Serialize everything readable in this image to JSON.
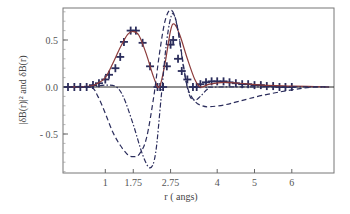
{
  "chart_data": {
    "type": "line",
    "title": "",
    "xlabel": "r ( angs)",
    "ylabel": "|δB(r)|² and δB(r)",
    "xlim": [
      -0.13,
      7.13
    ],
    "ylim": [
      -0.91,
      0.84
    ],
    "grid": false,
    "legend": null,
    "x_ticks": [
      {
        "value": 1,
        "label": "1"
      },
      {
        "value": 1.75,
        "label": "1.75"
      },
      {
        "value": 2.75,
        "label": "2.75"
      },
      {
        "value": 4,
        "label": "4"
      },
      {
        "value": 5,
        "label": "5"
      },
      {
        "value": 6,
        "label": "6"
      }
    ],
    "y_ticks": [
      {
        "value": 0.5,
        "label": "0.5"
      },
      {
        "value": 0.0,
        "label": "0.0"
      },
      {
        "value": -0.5,
        "label": "- 0.5"
      }
    ],
    "series": [
      {
        "name": "|δB(r)|² data",
        "style": "markers-cross",
        "color": "#2b2d5c",
        "x": [
          0.0,
          0.17,
          0.33,
          0.5,
          0.67,
          0.83,
          1.0,
          1.1,
          1.27,
          1.4,
          1.5,
          1.68,
          1.82,
          2.0,
          2.2,
          2.4,
          2.47,
          2.55,
          2.65,
          2.75,
          2.82,
          2.95,
          3.05,
          3.2,
          3.35,
          3.45,
          3.55,
          3.7,
          3.85,
          4.0,
          4.17,
          4.33,
          4.5,
          4.67,
          4.83,
          5.0,
          5.17,
          5.33,
          5.5,
          5.67,
          5.83,
          6.0
        ],
        "y": [
          0.0,
          0.0,
          0.0,
          0.0,
          0.02,
          0.04,
          0.08,
          0.13,
          0.2,
          0.32,
          0.48,
          0.6,
          0.6,
          0.47,
          0.22,
          0.0,
          0.0,
          0.0,
          0.22,
          0.45,
          0.5,
          0.3,
          0.17,
          0.08,
          0.0,
          0.0,
          0.03,
          0.05,
          0.06,
          0.06,
          0.06,
          0.05,
          0.04,
          0.03,
          0.03,
          0.02,
          0.02,
          0.01,
          0.01,
          0.0,
          0.0,
          0.0
        ]
      },
      {
        "name": "|δB(r)|² fit",
        "style": "solid",
        "color": "#8b3a3a",
        "x": [
          0.0,
          0.6,
          0.8,
          1.0,
          1.2,
          1.4,
          1.6,
          1.75,
          1.9,
          2.1,
          2.3,
          2.45,
          2.6,
          2.75,
          2.85,
          3.0,
          3.2,
          3.4,
          3.55,
          3.8,
          4.2,
          4.6,
          5.2,
          6.0,
          7.0
        ],
        "y": [
          0.0,
          0.01,
          0.04,
          0.1,
          0.25,
          0.42,
          0.56,
          0.59,
          0.55,
          0.35,
          0.1,
          0.0,
          0.25,
          0.6,
          0.67,
          0.55,
          0.3,
          0.08,
          0.0,
          0.03,
          0.05,
          0.04,
          0.02,
          0.01,
          0.0
        ]
      },
      {
        "name": "δB(r) dashed",
        "style": "dashed",
        "color": "#2b2d5c",
        "x": [
          0.0,
          0.6,
          0.8,
          1.0,
          1.2,
          1.4,
          1.6,
          1.75,
          1.9,
          2.1,
          2.3,
          2.45,
          2.6,
          2.75,
          2.9,
          3.05,
          3.2,
          3.4,
          3.6,
          3.8,
          4.2,
          4.6,
          5.2,
          6.0,
          6.6,
          7.0
        ],
        "y": [
          0.0,
          0.0,
          -0.1,
          -0.28,
          -0.48,
          -0.62,
          -0.72,
          -0.74,
          -0.72,
          -0.55,
          -0.1,
          0.35,
          0.7,
          0.82,
          0.7,
          0.35,
          0.0,
          -0.15,
          -0.2,
          -0.21,
          -0.19,
          -0.15,
          -0.09,
          -0.03,
          0.0,
          0.0
        ]
      },
      {
        "name": "δB(r) dash-dot",
        "style": "dash-dot",
        "color": "#2b2d5c",
        "x": [
          0.0,
          0.6,
          1.0,
          1.3,
          1.5,
          1.75,
          2.0,
          2.2,
          2.35,
          2.5,
          2.65,
          2.8,
          2.95,
          3.1,
          3.25,
          3.4,
          3.55,
          3.75,
          4.0,
          7.0
        ],
        "y": [
          0.0,
          0.0,
          0.02,
          0.0,
          -0.12,
          -0.4,
          -0.72,
          -0.86,
          -0.7,
          -0.1,
          0.5,
          0.78,
          0.6,
          0.2,
          -0.08,
          -0.14,
          -0.1,
          -0.02,
          0.0,
          0.0
        ]
      }
    ]
  }
}
